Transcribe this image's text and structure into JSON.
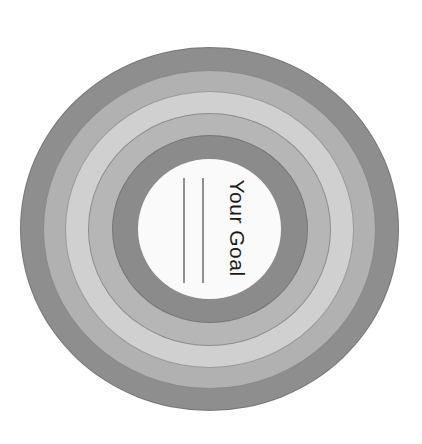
{
  "target": {
    "center_x": 209.5,
    "center_y": 229,
    "rings": [
      {
        "name": "ring-1-outer",
        "rx": 189.5,
        "ry": 182,
        "color": "#8e8e8e"
      },
      {
        "name": "ring-2",
        "rx": 166.5,
        "ry": 159.5,
        "color": "#b1b1b1"
      },
      {
        "name": "ring-3",
        "rx": 144.5,
        "ry": 138.5,
        "color": "#d0d0d0"
      },
      {
        "name": "ring-4",
        "rx": 121.5,
        "ry": 116.5,
        "color": "#b6b6b6"
      },
      {
        "name": "ring-5-inner",
        "rx": 98,
        "ry": 94,
        "color": "#8b8b8b"
      }
    ],
    "center": {
      "rx": 71.5,
      "ry": 70,
      "color": "#fafafa"
    }
  },
  "goal": {
    "label": "Your Goal",
    "lines": [
      {
        "x": 183,
        "top": 178,
        "bottom": 283
      },
      {
        "x": 202,
        "top": 178,
        "bottom": 283
      }
    ]
  }
}
